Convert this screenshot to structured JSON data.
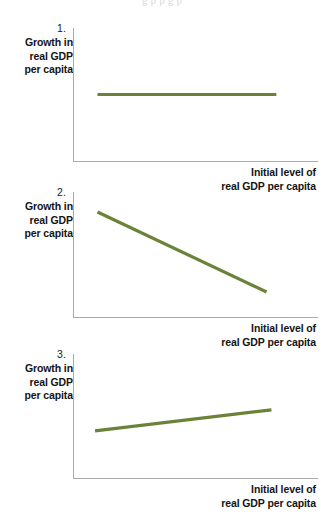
{
  "page": {
    "bleed_text": "g               p        p           g    p",
    "line_color": "#6b8239",
    "axis_color": "#a9abae",
    "text_color": "#141414",
    "background": "#ffffff"
  },
  "axis_labels": {
    "y_line1": "Growth in",
    "y_line2": "real GDP",
    "y_line3": "per capita",
    "x_line1": "Initial level of",
    "x_line2": "real GDP per capita"
  },
  "charts": [
    {
      "number": "1.",
      "type": "line",
      "title": "",
      "xlabel": "Initial level of real GDP per capita",
      "ylabel": "Growth in real GDP per capita",
      "relationship": "no relationship",
      "x": [
        0.1,
        0.83
      ],
      "y": [
        0.5,
        0.5
      ],
      "xlim": [
        0,
        1
      ],
      "ylim": [
        0,
        1
      ],
      "grid": false,
      "legend": "none"
    },
    {
      "number": "2.",
      "type": "line",
      "title": "",
      "xlabel": "Initial level of real GDP per capita",
      "ylabel": "Growth in real GDP per capita",
      "relationship": "negative relationship",
      "x": [
        0.1,
        0.79
      ],
      "y": [
        0.84,
        0.2
      ],
      "xlim": [
        0,
        1
      ],
      "ylim": [
        0,
        1
      ],
      "grid": false,
      "legend": "none"
    },
    {
      "number": "3.",
      "type": "line",
      "title": "",
      "xlabel": "Initial level of real GDP per capita",
      "ylabel": "Growth in real GDP per capita",
      "relationship": "positive relationship",
      "x": [
        0.09,
        0.81
      ],
      "y": [
        0.38,
        0.55
      ],
      "xlim": [
        0,
        1
      ],
      "ylim": [
        0,
        1
      ],
      "grid": false,
      "legend": "none"
    }
  ],
  "chart_data": {
    "type": "line",
    "xlabel": "Initial level of real GDP per capita",
    "ylabel": "Growth in real GDP per capita",
    "xlim": [
      0,
      1
    ],
    "ylim": [
      0,
      1
    ],
    "grid": false,
    "legend": "none",
    "panels": [
      {
        "number": "1.",
        "series": [
          {
            "name": "no relationship",
            "x": [
              0.1,
              0.83
            ],
            "values": [
              0.5,
              0.5
            ]
          }
        ]
      },
      {
        "number": "2.",
        "series": [
          {
            "name": "negative relationship (convergence)",
            "x": [
              0.1,
              0.79
            ],
            "values": [
              0.84,
              0.2
            ]
          }
        ]
      },
      {
        "number": "3.",
        "series": [
          {
            "name": "positive relationship (divergence)",
            "x": [
              0.09,
              0.81
            ],
            "values": [
              0.38,
              0.55
            ]
          }
        ]
      }
    ]
  }
}
